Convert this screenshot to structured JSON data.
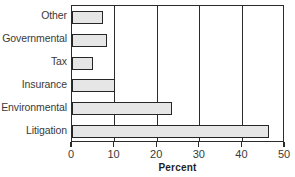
{
  "chart_data": {
    "type": "bar",
    "orientation": "horizontal",
    "title": "",
    "subtitle": "",
    "xlabel": "Percent",
    "ylabel": "",
    "categories": [
      "Litigation",
      "Environmental",
      "Insurance",
      "Tax",
      "Governmental",
      "Other"
    ],
    "values": [
      46.2,
      23.5,
      10.2,
      4.9,
      8.2,
      7.2
    ],
    "series": [
      {
        "name": "Percent",
        "values": [
          46.2,
          23.5,
          10.2,
          4.9,
          8.2,
          7.2
        ]
      }
    ],
    "display_order_top_to_bottom": [
      "Other",
      "Governmental",
      "Tax",
      "Insurance",
      "Environmental",
      "Litigation"
    ],
    "xlim": [
      0,
      50
    ],
    "xticks": [
      0,
      10,
      20,
      30,
      40,
      50
    ],
    "xtick_labels": [
      "0",
      "10",
      "20",
      "30",
      "40",
      "50"
    ],
    "grid": {
      "vertical": true,
      "horizontal": false,
      "gridline_values": [
        10,
        20,
        30,
        40
      ]
    },
    "legend": {
      "visible": false,
      "position": "none",
      "entries": []
    },
    "colors": {
      "bar_fill": "#e6e6e6",
      "bar_edge": "#262626",
      "axis": "#2b2b2b",
      "text": "#3a3a3a",
      "axis_title": "#1e1e1e",
      "background": "#ffffff"
    }
  },
  "bars": [
    {
      "label": "Other",
      "value": 7.2,
      "value_text": "7.2"
    },
    {
      "label": "Governmental",
      "value": 8.2,
      "value_text": "8.2"
    },
    {
      "label": "Tax",
      "value": 4.9,
      "value_text": "4.9"
    },
    {
      "label": "Insurance",
      "value": 10.2,
      "value_text": "10.2"
    },
    {
      "label": "Environmental",
      "value": 23.5,
      "value_text": "23.5"
    },
    {
      "label": "Litigation",
      "value": 46.2,
      "value_text": "46.2"
    }
  ],
  "axis": {
    "x_title": "Percent",
    "ticks": [
      {
        "label": "0",
        "value": 0
      },
      {
        "label": "10",
        "value": 10
      },
      {
        "label": "20",
        "value": 20
      },
      {
        "label": "30",
        "value": 30
      },
      {
        "label": "40",
        "value": 40
      },
      {
        "label": "50",
        "value": 50
      }
    ]
  }
}
